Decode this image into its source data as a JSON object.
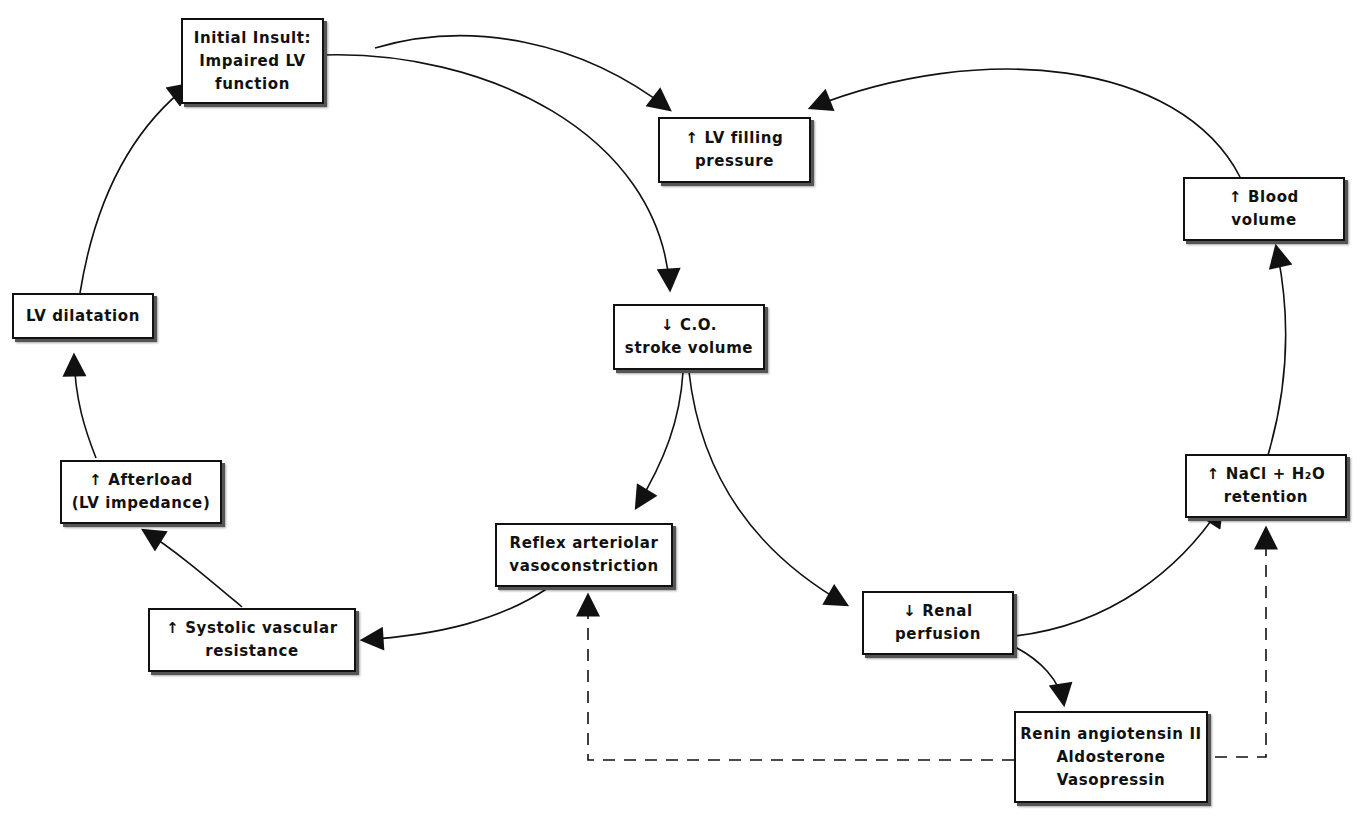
{
  "diagram": {
    "type": "flowchart",
    "nodes": {
      "initial_insult": {
        "id": "initial_insult",
        "lines": [
          "Initial Insult:",
          "Impaired LV",
          "function"
        ]
      },
      "lv_filling": {
        "id": "lv_filling",
        "lines": [
          "↑ LV filling",
          "pressure"
        ]
      },
      "blood_volume": {
        "id": "blood_volume",
        "lines": [
          "↑ Blood",
          "volume"
        ]
      },
      "lv_dilatation": {
        "id": "lv_dilatation",
        "lines": [
          "LV dilatation"
        ]
      },
      "co_stroke": {
        "id": "co_stroke",
        "lines": [
          "↓ C.O.",
          "stroke volume"
        ]
      },
      "afterload": {
        "id": "afterload",
        "lines": [
          "↑ Afterload",
          "(LV impedance)"
        ]
      },
      "nacl_retention": {
        "id": "nacl_retention",
        "lines": [
          "↑ NaCl + H₂O",
          "retention"
        ]
      },
      "reflex_vaso": {
        "id": "reflex_vaso",
        "lines": [
          "Reflex arteriolar",
          "vasoconstriction"
        ]
      },
      "renal_perfusion": {
        "id": "renal_perfusion",
        "lines": [
          "↓ Renal",
          "perfusion"
        ]
      },
      "systolic_resistance": {
        "id": "systolic_resistance",
        "lines": [
          "↑ Systolic vascular",
          "resistance"
        ]
      },
      "renin": {
        "id": "renin",
        "lines": [
          "Renin angiotensin II",
          "Aldosterone",
          "Vasopressin"
        ]
      }
    },
    "edges": [
      {
        "from": "initial_insult",
        "to": "lv_filling",
        "style": "solid"
      },
      {
        "from": "initial_insult",
        "to": "co_stroke",
        "style": "solid"
      },
      {
        "from": "blood_volume",
        "to": "lv_filling",
        "style": "solid"
      },
      {
        "from": "co_stroke",
        "to": "reflex_vaso",
        "style": "solid"
      },
      {
        "from": "co_stroke",
        "to": "renal_perfusion",
        "style": "solid"
      },
      {
        "from": "reflex_vaso",
        "to": "systolic_resistance",
        "style": "solid"
      },
      {
        "from": "systolic_resistance",
        "to": "afterload",
        "style": "solid"
      },
      {
        "from": "afterload",
        "to": "lv_dilatation",
        "style": "solid"
      },
      {
        "from": "lv_dilatation",
        "to": "initial_insult",
        "style": "solid"
      },
      {
        "from": "renal_perfusion",
        "to": "nacl_retention",
        "style": "solid"
      },
      {
        "from": "renal_perfusion",
        "to": "renin",
        "style": "solid"
      },
      {
        "from": "nacl_retention",
        "to": "blood_volume",
        "style": "solid"
      },
      {
        "from": "renin",
        "to": "reflex_vaso",
        "style": "dashed"
      },
      {
        "from": "renin",
        "to": "nacl_retention",
        "style": "dashed"
      }
    ],
    "colors": {
      "line": "#111111",
      "box_border": "#111111",
      "background": "#ffffff"
    }
  }
}
